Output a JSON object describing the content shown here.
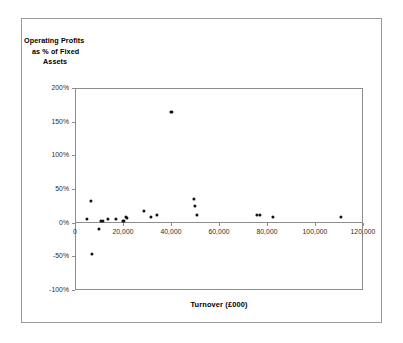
{
  "chart_data": {
    "type": "scatter",
    "title": "",
    "xlabel": "Turnover (£000)",
    "ylabel": "Operating Profits as % of Fixed Assets",
    "ylabel_lines": [
      "Operating Profits",
      "as % of Fixed",
      "Assets"
    ],
    "xlim": [
      0,
      120000
    ],
    "ylim": [
      -100,
      200
    ],
    "grid": false,
    "legend": null,
    "x_tick_labels": [
      "0",
      "20,000",
      "40,000",
      "60,000",
      "80,000",
      "100,000",
      "120,000"
    ],
    "x_tick_values": [
      0,
      20000,
      40000,
      60000,
      80000,
      100000,
      120000
    ],
    "y_tick_labels": [
      "200%",
      "150%",
      "100%",
      "50%",
      "0%",
      "-50%",
      "-100%"
    ],
    "y_tick_values": [
      200,
      150,
      100,
      50,
      0,
      -50,
      -100
    ],
    "marker": "filled-circle",
    "marker_color": "#111111",
    "points": [
      {
        "x": 5000,
        "y": 6
      },
      {
        "x": 6800,
        "y": 32
      },
      {
        "x": 7000,
        "y": -46
      },
      {
        "x": 10000,
        "y": -10
      },
      {
        "x": 10800,
        "y": 2
      },
      {
        "x": 11600,
        "y": 2
      },
      {
        "x": 13800,
        "y": 5
      },
      {
        "x": 17000,
        "y": 5
      },
      {
        "x": 20200,
        "y": 3
      },
      {
        "x": 21200,
        "y": 9
      },
      {
        "x": 21600,
        "y": 7
      },
      {
        "x": 28800,
        "y": 17
      },
      {
        "x": 31600,
        "y": 8
      },
      {
        "x": 34000,
        "y": 11
      },
      {
        "x": 40200,
        "y": 164
      },
      {
        "x": 49600,
        "y": 35
      },
      {
        "x": 50000,
        "y": 25
      },
      {
        "x": 50800,
        "y": 11
      },
      {
        "x": 75800,
        "y": 12
      },
      {
        "x": 77000,
        "y": 12
      },
      {
        "x": 82600,
        "y": 9
      },
      {
        "x": 110800,
        "y": 9
      }
    ]
  },
  "colors": {
    "frame": "#9a9a9a",
    "axis": "#8d8d8d",
    "text": "#000000",
    "tick_text": "#2b2b2b",
    "marker": "#111111",
    "background": "#ffffff"
  }
}
